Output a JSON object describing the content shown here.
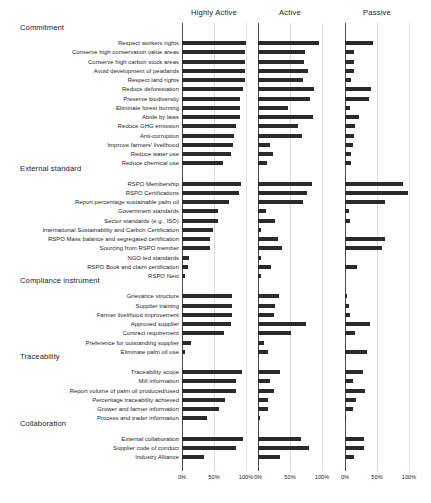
{
  "chart_data": {
    "type": "bar",
    "title": "",
    "subtitle": "",
    "xlabel": "",
    "ylabel": "",
    "xlim": [
      0,
      100
    ],
    "xticks": [
      0,
      50,
      100
    ],
    "xticklabels": [
      "0%",
      "50%",
      "100%"
    ],
    "grid": true,
    "orientation": "horizontal",
    "legend_position": "top (panel headers)",
    "panels": [
      {
        "name": "Highly Active",
        "label": "Highly Active"
      },
      {
        "name": "Active",
        "label": "Active"
      },
      {
        "name": "Passive",
        "label": "Passive"
      }
    ],
    "groups": [
      {
        "label": "Commitment",
        "items": [
          {
            "category": "Respect workers rights",
            "values": [
              100,
              96,
              44
            ]
          },
          {
            "category": "Conserve high conservation value areas",
            "values": [
              99,
              73,
              14
            ]
          },
          {
            "category": "Conserve high carbon stock areas",
            "values": [
              99,
              72,
              14
            ]
          },
          {
            "category": "Avoid development of peatlands",
            "values": [
              99,
              78,
              14
            ]
          },
          {
            "category": "Respect land rights",
            "values": [
              99,
              70,
              9
            ]
          },
          {
            "category": "Reduce deforestation",
            "values": [
              96,
              87,
              41
            ]
          },
          {
            "category": "Preserve biodiversity",
            "values": [
              91,
              82,
              38
            ]
          },
          {
            "category": "Eliminate forest burning",
            "values": [
              90,
              47,
              8
            ]
          },
          {
            "category": "Abide by laws",
            "values": [
              90,
              86,
              22
            ]
          },
          {
            "category": "Reduce GHG emission",
            "values": [
              85,
              62,
              15
            ]
          },
          {
            "category": "Anti-corruption",
            "values": [
              82,
              68,
              14
            ]
          },
          {
            "category": "Improve farmers' livelihood",
            "values": [
              79,
              19,
              12
            ]
          },
          {
            "category": "Reduce water use",
            "values": [
              77,
              23,
              9
            ]
          },
          {
            "category": "Reduce chemical use",
            "values": [
              64,
              14,
              9
            ]
          }
        ]
      },
      {
        "label": "External standard",
        "items": [
          {
            "category": "RSPO Membership",
            "values": [
              92,
              84,
              90
            ]
          },
          {
            "category": "RSPO Certifications",
            "values": [
              89,
              77,
              99
            ]
          },
          {
            "category": "Report percentage sustainable palm oil",
            "values": [
              73,
              71,
              62
            ]
          },
          {
            "category": "Government standards",
            "values": [
              56,
              12,
              7
            ]
          },
          {
            "category": "Sector standards (e.g., ISO)",
            "values": [
              57,
              27,
              8
            ]
          },
          {
            "category": "International Sustainability and Carbon Certification",
            "values": [
              49,
              4,
              0
            ]
          },
          {
            "category": "RSPO Mass balance and segregated certification",
            "values": [
              44,
              32,
              62
            ]
          },
          {
            "category": "Sourcing from RSPO member",
            "values": [
              44,
              38,
              58
            ]
          },
          {
            "category": "NGO-led standards",
            "values": [
              11,
              4,
              0
            ]
          },
          {
            "category": "RSPO Book and claim certification",
            "values": [
              10,
              20,
              19
            ]
          },
          {
            "category": "RSPO Next",
            "values": [
              4,
              4,
              0
            ]
          }
        ]
      },
      {
        "label": "Compliance instrument",
        "items": [
          {
            "category": "Grievance structure",
            "values": [
              78,
              33,
              3
            ]
          },
          {
            "category": "Supplier training",
            "values": [
              78,
              26,
              6
            ]
          },
          {
            "category": "Farmer livelihood improvement",
            "values": [
              78,
              25,
              8
            ]
          },
          {
            "category": "Approved supplier",
            "values": [
              77,
              75,
              39
            ]
          },
          {
            "category": "Contract requirement",
            "values": [
              65,
              51,
              15
            ]
          },
          {
            "category": "Preference for outstanding supplier",
            "values": [
              14,
              10,
              0
            ]
          },
          {
            "category": "Eliminate palm oil use",
            "values": [
              4,
              16,
              34
            ]
          }
        ]
      },
      {
        "label": "Traceability",
        "items": [
          {
            "category": "Traceability scope",
            "values": [
              94,
              34,
              28
            ]
          },
          {
            "category": "Mill information",
            "values": [
              84,
              18,
              13
            ]
          },
          {
            "category": "Report volume of palm oil produced/used",
            "values": [
              84,
              25,
              32
            ]
          },
          {
            "category": "Percentage traceability achieved",
            "values": [
              67,
              15,
              17
            ]
          },
          {
            "category": "Grower and farmer information",
            "values": [
              58,
              15,
              13
            ]
          },
          {
            "category": "Process and trader information",
            "values": [
              39,
              3,
              2
            ]
          }
        ]
      },
      {
        "label": "Collaboration",
        "items": [
          {
            "category": "External collaboration",
            "values": [
              95,
              67,
              30
            ]
          },
          {
            "category": "Supplier code of conduct",
            "values": [
              85,
              79,
              29
            ]
          },
          {
            "category": "Industry Alliance",
            "values": [
              34,
              34,
              14
            ]
          }
        ]
      }
    ]
  },
  "style": {
    "bar_color": "#2b2b2b",
    "grid_color": "#d9d9d9",
    "axis_color": "#4a4a4a",
    "background": "#ffffff"
  }
}
